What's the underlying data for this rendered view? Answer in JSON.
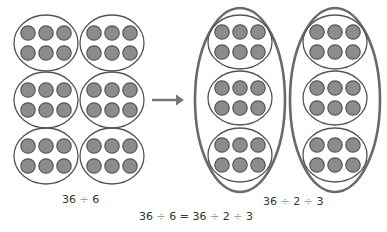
{
  "colors": {
    "dot_fill": "#8c8c8c",
    "dot_stroke": "#555555",
    "ellipse_stroke": "#555555",
    "outer_ellipse_stroke": "#6a6a6a",
    "arrow": "#777777",
    "text": "#333333",
    "operator": "#9a9a9a"
  },
  "left_grid": {
    "groups": 6,
    "dots_per_group": 6,
    "label": {
      "a": "36",
      "op": "÷",
      "b": "6"
    }
  },
  "arrow": {
    "icon": "arrow-right-icon"
  },
  "right_grid": {
    "outer_groups": 2,
    "inner_groups_per_outer": 3,
    "dots_per_inner_group": 6,
    "label": {
      "a": "36",
      "op1": "÷",
      "b": "2",
      "op2": "÷",
      "c": "3"
    }
  },
  "equation": {
    "a": "36",
    "op1": "÷",
    "b": "6",
    "eq": "=",
    "c": "36",
    "op2": "÷",
    "d": "2",
    "op3": "÷",
    "e": "3"
  }
}
